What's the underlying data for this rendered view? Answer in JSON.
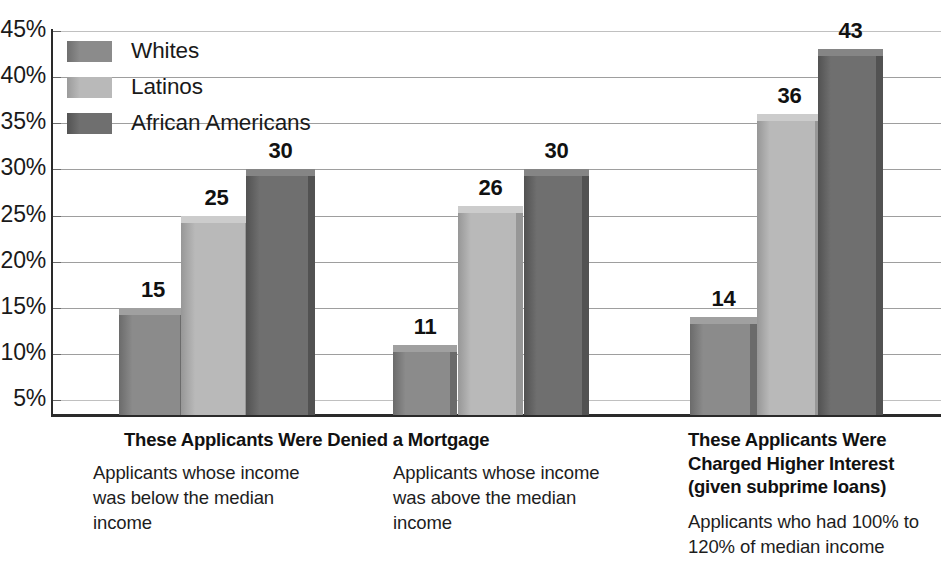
{
  "chart_data": {
    "type": "bar",
    "title": "",
    "xlabel": "",
    "ylabel": "",
    "ylim": [
      3.5,
      45
    ],
    "grid": true,
    "legend_position": "top-left",
    "y_tick_labels": [
      "45%",
      "40%",
      "35%",
      "30%",
      "25%",
      "20%",
      "15%",
      "10%",
      "5%"
    ],
    "y_tick_values": [
      45,
      40,
      35,
      30,
      25,
      20,
      15,
      10,
      5
    ],
    "categories": [
      "Applicants whose income was below the median income",
      "Applicants whose income was above the median income",
      "Applicants who had 100% to 120% of median income"
    ],
    "series": [
      {
        "name": "Whites",
        "color": "#8b8b8b",
        "values": [
          15,
          11,
          14
        ]
      },
      {
        "name": "Latinos",
        "color": "#b9b9b9",
        "values": [
          25,
          26,
          36
        ]
      },
      {
        "name": "African Americans",
        "color": "#6f6f6f",
        "values": [
          30,
          30,
          43
        ]
      }
    ],
    "data_labels": [
      [
        "15",
        "25",
        "30"
      ],
      [
        "11",
        "26",
        "30"
      ],
      [
        "14",
        "36",
        "43"
      ]
    ]
  },
  "legend": {
    "items": [
      {
        "label": "Whites",
        "color": "#8b8b8b",
        "side": "#6f6f6f",
        "top": "#a3a3a3"
      },
      {
        "label": "Latinos",
        "color": "#b9b9b9",
        "side": "#9b9b9b",
        "top": "#cfcfcf"
      },
      {
        "label": "African Americans",
        "color": "#6f6f6f",
        "side": "#535353",
        "top": "#878787"
      }
    ]
  },
  "axis": {
    "ticks": [
      {
        "label": "45%"
      },
      {
        "label": "40%"
      },
      {
        "label": "35%"
      },
      {
        "label": "30%"
      },
      {
        "label": "25%"
      },
      {
        "label": "20%"
      },
      {
        "label": "15%"
      },
      {
        "label": "10%"
      },
      {
        "label": "5%"
      }
    ]
  },
  "captions": {
    "left_heading": "These Applicants Were Denied a Mortgage",
    "group1_body": "Applicants whose income was below the median income",
    "group2_body": "Applicants whose income was above the median income",
    "right_heading": "These Applicants Were Charged Higher Interest (given subprime loans)",
    "right_body": "Applicants who had 100% to 120% of median income"
  },
  "bars": [
    {
      "group": 1,
      "series": "Whites",
      "value": 15,
      "label": "15",
      "x": 119,
      "w": 61,
      "color": "#8b8b8b",
      "side": "#6b6b6b",
      "top": "#a0a0a0"
    },
    {
      "group": 1,
      "series": "Latinos",
      "value": 25,
      "label": "25",
      "x": 181,
      "w": 64,
      "color": "#b9b9b9",
      "side": "#979797",
      "top": "#cccccc"
    },
    {
      "group": 1,
      "series": "African Americans",
      "value": 30,
      "label": "30",
      "x": 246,
      "w": 62,
      "color": "#6f6f6f",
      "side": "#525252",
      "top": "#858585"
    },
    {
      "group": 2,
      "series": "Whites",
      "value": 11,
      "label": "11",
      "x": 393,
      "w": 57,
      "color": "#8b8b8b",
      "side": "#6b6b6b",
      "top": "#a0a0a0"
    },
    {
      "group": 2,
      "series": "Latinos",
      "value": 26,
      "label": "26",
      "x": 458,
      "w": 58,
      "color": "#b9b9b9",
      "side": "#979797",
      "top": "#cccccc"
    },
    {
      "group": 2,
      "series": "African Americans",
      "value": 30,
      "label": "30",
      "x": 524,
      "w": 58,
      "color": "#6f6f6f",
      "side": "#525252",
      "top": "#858585"
    },
    {
      "group": 3,
      "series": "Whites",
      "value": 14,
      "label": "14",
      "x": 690,
      "w": 60,
      "color": "#8b8b8b",
      "side": "#6b6b6b",
      "top": "#a0a0a0"
    },
    {
      "group": 3,
      "series": "Latinos",
      "value": 36,
      "label": "36",
      "x": 757,
      "w": 58,
      "color": "#b9b9b9",
      "side": "#979797",
      "top": "#cccccc"
    },
    {
      "group": 3,
      "series": "African Americans",
      "value": 43,
      "label": "43",
      "x": 818,
      "w": 58,
      "color": "#6f6f6f",
      "side": "#525252",
      "top": "#858585"
    }
  ]
}
